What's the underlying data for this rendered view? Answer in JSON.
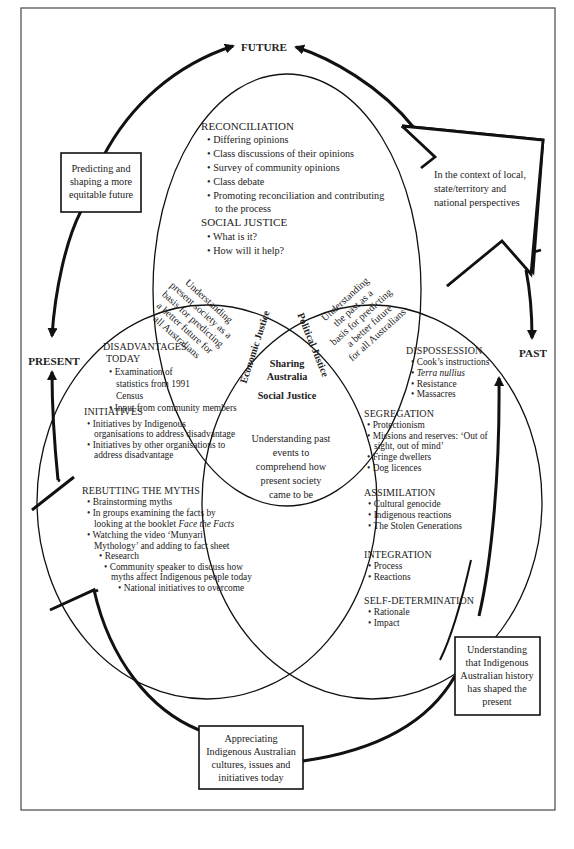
{
  "labels": {
    "future": "FUTURE",
    "present": "PRESENT",
    "past": "PAST"
  },
  "boxes": {
    "predicting": [
      "Predicting and",
      "shaping a more",
      "equitable future"
    ],
    "context": [
      "In the context of local,",
      "state/territory and",
      "national perspectives"
    ],
    "understanding_history": [
      "Understanding",
      "that Indigenous",
      "Australian history",
      "has shaped the",
      "present"
    ],
    "appreciating": [
      "Appreciating",
      "Indigenous Australian",
      "cultures, issues and",
      "initiatives today"
    ]
  },
  "top_circle": {
    "reconciliation": {
      "heading": "RECONCILIATION",
      "items": [
        "Differing opinions",
        "Class discussions of their opinions",
        "Survey of community opinions",
        "Class debate",
        "Promoting reconciliation and contributing",
        "to the process"
      ]
    },
    "social_justice": {
      "heading": "SOCIAL JUSTICE",
      "items": [
        "What is it?",
        "How will it help?"
      ]
    }
  },
  "overlaps": {
    "top_left": [
      "Understanding",
      "present society as a",
      "basis for predicting",
      "a better future for",
      "all Australians"
    ],
    "top_right": [
      "Understanding",
      "the past as a",
      "basis for predicting",
      "a better future",
      "for all Australians"
    ],
    "bottom": [
      "Understanding past",
      "events to",
      "comprehend how",
      "present society",
      "came to be"
    ],
    "center": {
      "economic": "Economic Justice",
      "political": "Political Justice",
      "sharing": [
        "Sharing",
        "Australia"
      ],
      "social": "Social Justice"
    }
  },
  "left_circle": {
    "disadvantages": {
      "heading": [
        "DISADVANTAGES",
        "TODAY"
      ],
      "items": [
        "Examination of",
        "statistics from 1991",
        "Census",
        "Input from community members"
      ]
    },
    "initiatives": {
      "heading": "INITIATIVES",
      "items": [
        "Initiatives by Indigenous",
        "organisations to address disadvantage",
        "Initiatives by other organisations to",
        "address disadvantage"
      ]
    },
    "rebutting": {
      "heading": "REBUTTING THE MYTHS",
      "items": [
        "Brainstorming myths",
        "In groups examining the facts by",
        "looking at the booklet ",
        "Face the Facts",
        "Watching the video ‘Munyari",
        "Mythology’ and adding to fact sheet",
        "Research",
        "Community speaker to discuss how",
        "myths affect Indigenous people today",
        "National initiatives to overcome"
      ]
    }
  },
  "right_circle": {
    "dispossession": {
      "heading": "DISPOSSESSION",
      "items": [
        "Cook’s instructions",
        "Terra nullius",
        "Resistance",
        "Massacres"
      ]
    },
    "segregation": {
      "heading": "SEGREGATION",
      "items": [
        "Protectionism",
        "Missions and reserves: ‘Out of",
        "sight, out of mind’",
        "Fringe dwellers",
        "Dog licences"
      ]
    },
    "assimilation": {
      "heading": "ASSIMILATION",
      "items": [
        "Cultural genocide",
        "Indigenous reactions",
        "The Stolen Generations"
      ]
    },
    "integration": {
      "heading": "INTEGRATION",
      "items": [
        "Process",
        "Reactions"
      ]
    },
    "self_determination": {
      "heading": "SELF-DETERMINATION",
      "items": [
        "Rationale",
        "Impact"
      ]
    }
  },
  "bullet": "•",
  "colors": {
    "ink": "#222222",
    "frame": "#555555",
    "background": "#ffffff"
  }
}
